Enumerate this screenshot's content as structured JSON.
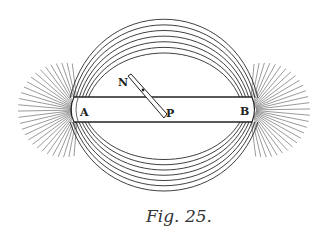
{
  "figure": {
    "caption": "Fig. 25.",
    "labels": {
      "pole_left": "A",
      "pole_right": "B",
      "needle_north": "N",
      "needle_pivot": "P"
    },
    "colors": {
      "ink": "#2a2a2a",
      "background": "#ffffff"
    }
  }
}
